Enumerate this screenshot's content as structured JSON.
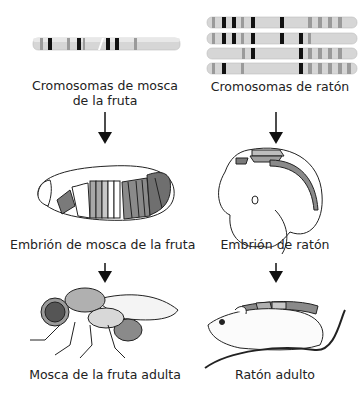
{
  "figure": {
    "left_column": {
      "chromosome_label_line1": "Cromosomas de mosca",
      "chromosome_label_line2": "de la fruta",
      "embryo_label": "Embrión de mosca de la fruta",
      "adult_label": "Mosca de la fruta adulta"
    },
    "right_column": {
      "chromosome_label": "Cromosomas de ratón",
      "embryo_label": "Embrión de ratón",
      "adult_label": "Ratón adulto"
    },
    "colors": {
      "chromosome_base": "#d4d4d4",
      "band_dark": "#111111",
      "band_mid": "#8f8f8f",
      "region_dark": "#7a7a7a",
      "region_mid": "#a8a8a8",
      "region_light": "#c8c8c8",
      "outline": "#222222"
    }
  }
}
